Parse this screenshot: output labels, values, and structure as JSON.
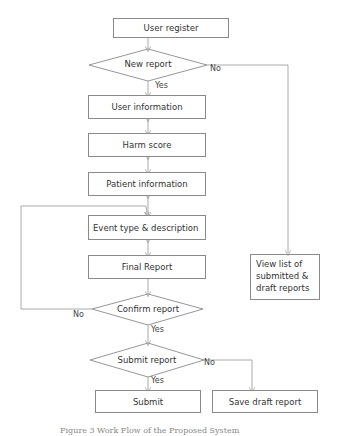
{
  "diagram": {
    "type": "flowchart",
    "nodes": {
      "user_register": "User register",
      "new_report": "New report",
      "user_information": "User information",
      "harm_score": "Harm score",
      "patient_information": "Patient information",
      "event_type": "Event type & description",
      "final_report": "Final Report",
      "confirm_report": "Confirm report",
      "submit_report": "Submit report",
      "submit": "Submit",
      "save_draft": "Save draft report",
      "view_list_line1": "View list of",
      "view_list_line2": "submitted &",
      "view_list_line3": "draft reports"
    },
    "edge_labels": {
      "new_report_no": "No",
      "new_report_yes": "Yes",
      "confirm_no": "No",
      "confirm_yes": "Yes",
      "submit_no": "No",
      "submit_yes": "Yes"
    },
    "caption": "Figure 3 Work Flow of the Proposed System"
  }
}
